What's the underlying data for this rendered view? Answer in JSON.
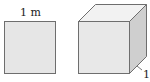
{
  "figures": {
    "square": {
      "label": "1 m",
      "fill": "#e6e6e6",
      "stroke": "#6e6e6e"
    },
    "cube": {
      "label": "1",
      "front_fill": "#e8e8e8",
      "top_fill": "#f2f2f2",
      "side_fill": "#cfcfcf",
      "stroke": "#6e6e6e"
    }
  }
}
